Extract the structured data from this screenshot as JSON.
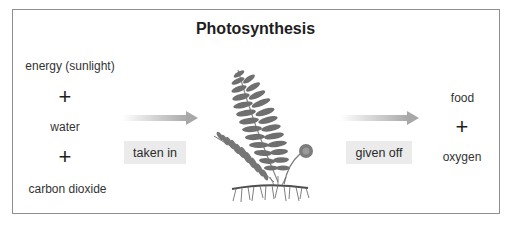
{
  "title": "Photosynthesis",
  "inputs": {
    "items": [
      "energy (sunlight)",
      "water",
      "carbon dioxide"
    ],
    "plus": "+"
  },
  "process": {
    "in_label": "taken in",
    "out_label": "given off",
    "center_image": "fern-plant-illustration"
  },
  "outputs": {
    "items": [
      "food",
      "oxygen"
    ],
    "plus": "+"
  },
  "colors": {
    "frame_border": "#8e8e8e",
    "label_bg": "#ebebeb",
    "arrow": "#b4b4b4",
    "fern": "#6e6e6e"
  }
}
